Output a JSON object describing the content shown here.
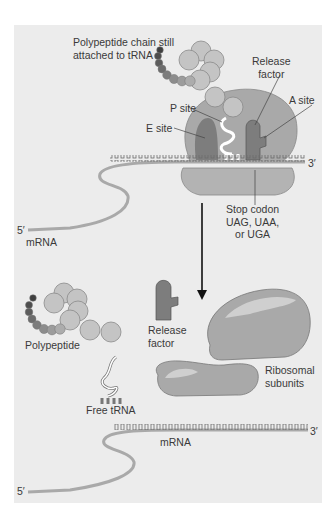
{
  "figure": {
    "top_panel": {
      "labels": {
        "polypeptide_line1": "Polypeptide chain still",
        "polypeptide_line2": "attached to tRNA",
        "release_factor_line1": "Release",
        "release_factor_line2": "factor",
        "a_site": "A site",
        "p_site": "P site",
        "e_site": "E site",
        "three_prime": "3′",
        "five_prime": "5′",
        "mrna": "mRNA",
        "stop_codon_line1": "Stop codon",
        "stop_codon_line2": "UAG, UAA,",
        "stop_codon_line3": "or UGA"
      }
    },
    "bottom_panel": {
      "labels": {
        "polypeptide": "Polypeptide",
        "release_factor_line1": "Release",
        "release_factor_line2": "factor",
        "free_trna": "Free tRNA",
        "ribosomal_line1": "Ribosomal",
        "ribosomal_line2": "subunits",
        "mrna": "mRNA",
        "three_prime": "3′",
        "five_prime": "5′"
      }
    },
    "colors": {
      "background": "#ececec",
      "ribosome": "#a9a9a9",
      "ribosome_dark": "#7d7d7d",
      "amino_acid": "#c4c4c4",
      "chain_dark": "#4a4a4a",
      "text": "#3a3a3a"
    }
  }
}
